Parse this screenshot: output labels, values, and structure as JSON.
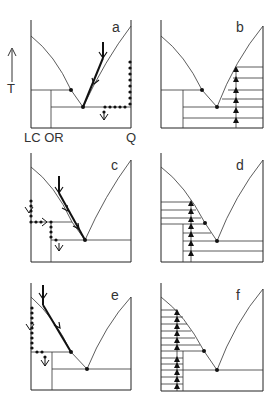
{
  "figure": {
    "axis": {
      "label": "T",
      "arrow_direction": "up"
    },
    "composition_labels": {
      "left": "LC OR",
      "right": "Q"
    },
    "panels": [
      {
        "id": "a",
        "label": "a",
        "process": "crystallization path from liquid with dotted reaction path on Q side",
        "markers": [
          "path-arrows",
          "dotted-path",
          "open-down-arrow"
        ]
      },
      {
        "id": "b",
        "label": "b",
        "process": "stepwise upward triangles on Q side",
        "markers": [
          "up-triangles",
          "tie-lines"
        ]
      },
      {
        "id": "c",
        "label": "c",
        "process": "crystallization path with dotted reaction path on LC/OR side",
        "markers": [
          "path-arrows",
          "dotted-path",
          "open-down-arrow"
        ]
      },
      {
        "id": "d",
        "label": "d",
        "process": "stepwise upward triangles on OR side",
        "markers": [
          "up-triangles",
          "tie-lines"
        ]
      },
      {
        "id": "e",
        "label": "e",
        "process": "crystallization path with dotted reaction path along LC axis",
        "markers": [
          "path-arrows",
          "dotted-path",
          "open-down-arrow"
        ]
      },
      {
        "id": "f",
        "label": "f",
        "process": "stepwise upward triangles along LC side",
        "markers": [
          "up-triangles",
          "tie-lines"
        ]
      }
    ],
    "colors": {
      "line": "#222222",
      "dot": "#111111",
      "background": "#ffffff"
    }
  }
}
